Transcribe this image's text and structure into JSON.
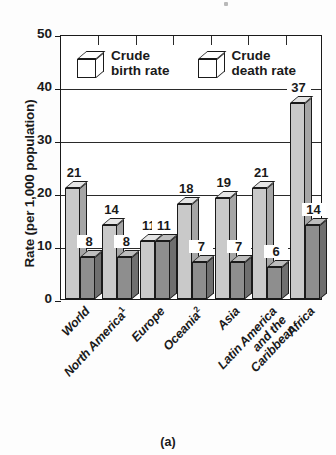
{
  "caption": "(a)",
  "axes": {
    "y_title": "Rate (per 1,000 population)",
    "y_ticks": [
      "0",
      "10",
      "20",
      "30",
      "40",
      "50"
    ]
  },
  "legend": {
    "items": [
      {
        "label": "Crude\nbirth rate",
        "icon": "cube-icon",
        "color": "#c9c9c9"
      },
      {
        "label": "Crude\ndeath rate",
        "icon": "cube-icon",
        "color": "#8e8e8e"
      }
    ]
  },
  "chart_data": {
    "type": "bar",
    "title": "",
    "xlabel": "",
    "ylabel": "Rate (per 1,000 population)",
    "ylim": [
      0,
      50
    ],
    "ytick_step": 10,
    "grid": true,
    "legend_position": "inside-top-left",
    "categories": [
      "World",
      "North America¹",
      "Europe",
      "Oceania²",
      "Asia",
      "Latin America\nand the\nCaribbean",
      "Africa"
    ],
    "series": [
      {
        "name": "Crude birth rate",
        "values": [
          21,
          14,
          11,
          18,
          19,
          21,
          37
        ]
      },
      {
        "name": "Crude death rate",
        "values": [
          8,
          8,
          11,
          7,
          7,
          6,
          14
        ]
      }
    ]
  }
}
